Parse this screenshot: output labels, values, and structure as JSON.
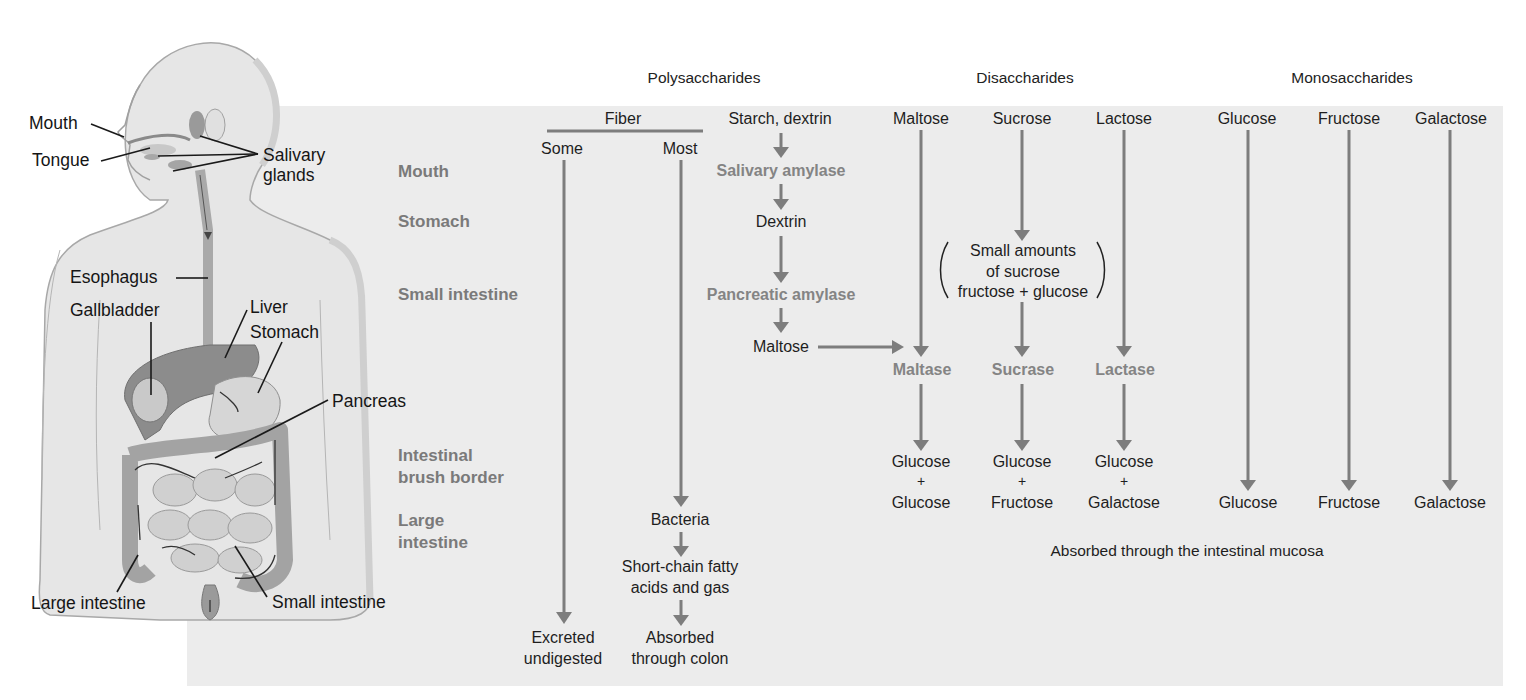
{
  "figure": {
    "column_groups": {
      "polysaccharides": "Polysaccharides",
      "disaccharides": "Disaccharides",
      "monosaccharides": "Monosaccharides"
    },
    "row_labels": {
      "mouth": "Mouth",
      "stomach": "Stomach",
      "small_intestine": "Small intestine",
      "brush_border_1": "Intestinal",
      "brush_border_2": "brush border",
      "large_intestine_1": "Large",
      "large_intestine_2": "intestine"
    },
    "anatomy_labels": {
      "mouth": "Mouth",
      "tongue": "Tongue",
      "salivary_1": "Salivary",
      "salivary_2": "glands",
      "esophagus": "Esophagus",
      "gallbladder": "Gallbladder",
      "liver": "Liver",
      "stomach": "Stomach",
      "pancreas": "Pancreas",
      "large_intestine": "Large intestine",
      "small_intestine": "Small intestine"
    },
    "fiber": {
      "title": "Fiber",
      "some": "Some",
      "most": "Most",
      "bacteria": "Bacteria",
      "scfa_1": "Short-chain fatty",
      "scfa_2": "acids and gas",
      "excreted_1": "Excreted",
      "excreted_2": "undigested",
      "absorbed_1": "Absorbed",
      "absorbed_2": "through colon"
    },
    "starch": {
      "title": "Starch, dextrin",
      "salivary_amylase": "Salivary amylase",
      "dextrin": "Dextrin",
      "pancreatic_amylase": "Pancreatic amylase",
      "maltose": "Maltose"
    },
    "disaccharides": {
      "maltose": "Maltose",
      "sucrose": "Sucrose",
      "lactose": "Lactose",
      "note_1": "Small amounts",
      "note_2": "of sucrose",
      "note_3": "fructose + glucose",
      "maltase": "Maltase",
      "sucrase": "Sucrase",
      "lactase": "Lactase",
      "prod_maltose_1": "Glucose",
      "prod_maltose_2": "+",
      "prod_maltose_3": "Glucose",
      "prod_sucrose_1": "Glucose",
      "prod_sucrose_2": "+",
      "prod_sucrose_3": "Fructose",
      "prod_lactose_1": "Glucose",
      "prod_lactose_2": "+",
      "prod_lactose_3": "Galactose"
    },
    "monosaccharides": {
      "glucose": "Glucose",
      "fructose": "Fructose",
      "galactose": "Galactose",
      "out_glucose": "Glucose",
      "out_fructose": "Fructose",
      "out_galactose": "Galactose"
    },
    "footer_note": "Absorbed through the intestinal mucosa",
    "colors": {
      "panel": "#ececec",
      "arrow": "#7d7d7d",
      "row_label": "#7a7a7a",
      "enzyme": "#848484",
      "text": "#1e1e1e"
    }
  }
}
